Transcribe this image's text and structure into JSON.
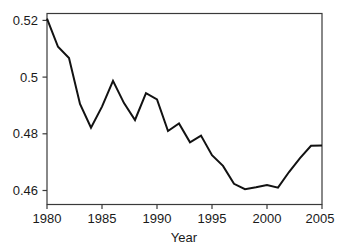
{
  "chart_data": {
    "type": "line",
    "title": "",
    "subtitle": "",
    "xlabel": "Year",
    "ylabel": "",
    "xlim": [
      1980,
      2005
    ],
    "ylim": [
      0.4515,
      0.5227
    ],
    "grid": false,
    "legend": null,
    "x_ticks": [
      1980,
      1985,
      1990,
      1995,
      2000,
      2005
    ],
    "x_tick_labels": [
      "1980",
      "1985",
      "1990",
      "1995",
      "2000",
      "2005"
    ],
    "y_ticks": [
      0.46,
      0.48,
      0.5,
      0.52
    ],
    "y_tick_labels": [
      "0.46",
      "0.48",
      "0.5",
      "0.52"
    ],
    "line_color": "#121212",
    "axis_color": "#3a3a3a",
    "background_color": "#ffffff",
    "x": [
      1980,
      1981,
      1982,
      1983,
      1984,
      1985,
      1986,
      1987,
      1988,
      1989,
      1990,
      1991,
      1992,
      1993,
      1994,
      1995,
      1996,
      1997,
      1998,
      1999,
      2000,
      2001,
      2002,
      2003,
      2004,
      2005
    ],
    "values": [
      0.5208,
      0.5103,
      0.5061,
      0.489,
      0.4801,
      0.488,
      0.4976,
      0.4893,
      0.483,
      0.493,
      0.4907,
      0.4789,
      0.4817,
      0.4747,
      0.4772,
      0.4699,
      0.4659,
      0.4592,
      0.4572,
      0.4579,
      0.4588,
      0.4578,
      0.4636,
      0.4688,
      0.4734,
      0.4735
    ],
    "series": [
      {
        "name": "series-1",
        "values": [
          0.5208,
          0.5103,
          0.5061,
          0.489,
          0.4801,
          0.488,
          0.4976,
          0.4893,
          0.483,
          0.493,
          0.4907,
          0.4789,
          0.4817,
          0.4747,
          0.4772,
          0.4699,
          0.4659,
          0.4592,
          0.4572,
          0.4579,
          0.4588,
          0.4578,
          0.4636,
          0.4688,
          0.4734,
          0.4735
        ]
      }
    ]
  }
}
